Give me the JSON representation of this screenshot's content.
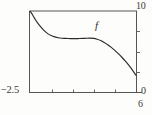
{
  "figure": {
    "kind": "cartesian-plot",
    "background_color": "#fdfdfb",
    "line_color": "#2b2b2b",
    "text_color": "#3a3a3a"
  },
  "labels": {
    "curve_label": "f",
    "y_max": "10",
    "y_min": "−2.5",
    "x_max": "6",
    "x_origin": "0"
  },
  "chart_data": {
    "type": "line",
    "title": "",
    "xlabel": "",
    "ylabel": "",
    "xlim": [
      0,
      6
    ],
    "ylim": [
      -2.5,
      10
    ],
    "grid": false,
    "legend": "none",
    "annotations": [
      {
        "text": "f",
        "x": 3.9,
        "y": 7.6
      }
    ],
    "axis_corner_labels": {
      "top_right": "10",
      "bottom_left": "−2.5",
      "bottom_right_outside": "6",
      "right_edge": "0"
    },
    "x_ticks": [
      1.3,
      2.5,
      3.7,
      4.9
    ],
    "y_ticks": [
      7.5,
      4.4,
      1.3
    ],
    "series": [
      {
        "name": "f",
        "x": [
          0.0,
          0.15,
          0.3,
          0.45,
          0.6,
          0.8,
          1.0,
          1.2,
          1.4,
          1.6,
          1.8,
          2.0,
          2.2,
          2.4,
          2.6,
          2.8,
          3.0,
          3.2,
          3.4,
          3.6,
          3.8,
          4.0,
          4.2,
          4.4,
          4.6,
          4.8,
          5.0,
          5.2,
          5.4,
          5.6,
          5.8,
          6.0
        ],
        "y": [
          10.0,
          9.4,
          8.7,
          8.1,
          7.6,
          7.0,
          6.55,
          6.25,
          6.05,
          5.92,
          5.85,
          5.82,
          5.8,
          5.8,
          5.8,
          5.8,
          5.82,
          5.85,
          5.86,
          5.82,
          5.7,
          5.5,
          5.2,
          4.85,
          4.45,
          4.0,
          3.5,
          2.95,
          2.35,
          1.7,
          1.0,
          0.2
        ]
      }
    ]
  }
}
